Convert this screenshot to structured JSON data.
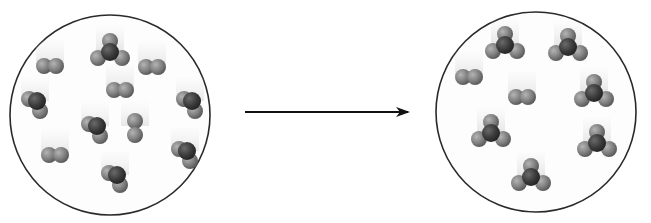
{
  "diagram": {
    "type": "reaction-particle-diagram",
    "colors": {
      "background": "#ffffff",
      "container_stroke": "#2a2a2a",
      "atom_light": "#8a8a8a",
      "atom_dark": "#3c3c3c",
      "arrow": "#111111",
      "motion_blur": "#d6d6d6"
    },
    "reactants": {
      "label": "",
      "container": {
        "cx": 110,
        "cy": 115,
        "r": 100
      },
      "molecules": [
        {
          "kind": "trigonal",
          "x": 110,
          "y": 52
        },
        {
          "kind": "diatomic",
          "x": 50,
          "y": 66
        },
        {
          "kind": "diatomic",
          "x": 152,
          "y": 67
        },
        {
          "kind": "diatomic",
          "x": 120,
          "y": 90
        },
        {
          "kind": "bent-dark",
          "x": 35,
          "y": 103
        },
        {
          "kind": "bent-dark",
          "x": 190,
          "y": 103
        },
        {
          "kind": "bent-dark",
          "x": 95,
          "y": 128
        },
        {
          "kind": "diatomic-vertical",
          "x": 135,
          "y": 128
        },
        {
          "kind": "diatomic",
          "x": 55,
          "y": 155
        },
        {
          "kind": "bent-dark",
          "x": 185,
          "y": 153
        },
        {
          "kind": "bent-dark",
          "x": 115,
          "y": 177
        }
      ]
    },
    "arrow": {
      "x1": 245,
      "y1": 112,
      "x2": 408,
      "y2": 112,
      "label": ""
    },
    "products": {
      "label": "",
      "container": {
        "cx": 536,
        "cy": 112,
        "r": 100
      },
      "molecules": [
        {
          "kind": "trigonal",
          "x": 505,
          "y": 45
        },
        {
          "kind": "trigonal",
          "x": 568,
          "y": 47
        },
        {
          "kind": "diatomic",
          "x": 469,
          "y": 77
        },
        {
          "kind": "diatomic",
          "x": 522,
          "y": 97
        },
        {
          "kind": "trigonal",
          "x": 594,
          "y": 93
        },
        {
          "kind": "trigonal",
          "x": 491,
          "y": 133
        },
        {
          "kind": "trigonal",
          "x": 597,
          "y": 143
        },
        {
          "kind": "trigonal",
          "x": 531,
          "y": 177
        }
      ]
    }
  }
}
